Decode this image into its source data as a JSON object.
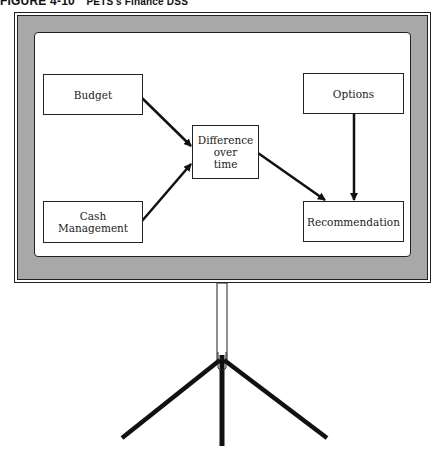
{
  "caption": {
    "figure_label": "FIGURE 4-10",
    "title": "PETS's Finance DSS"
  },
  "diagram": {
    "nodes": [
      {
        "id": "budget",
        "label": "Budget"
      },
      {
        "id": "cash",
        "label": "Cash Management"
      },
      {
        "id": "difference",
        "label_lines": [
          "Difference",
          "over",
          "time"
        ]
      },
      {
        "id": "options",
        "label": "Options"
      },
      {
        "id": "recommendation",
        "label": "Recommendation"
      }
    ],
    "edges": [
      {
        "from": "budget",
        "to": "difference"
      },
      {
        "from": "cash",
        "to": "difference"
      },
      {
        "from": "difference",
        "to": "recommendation"
      },
      {
        "from": "options",
        "to": "recommendation"
      }
    ],
    "colors": {
      "frame_gray": "#a8a8a8",
      "line": "#111111",
      "screen": "#ffffff"
    }
  }
}
